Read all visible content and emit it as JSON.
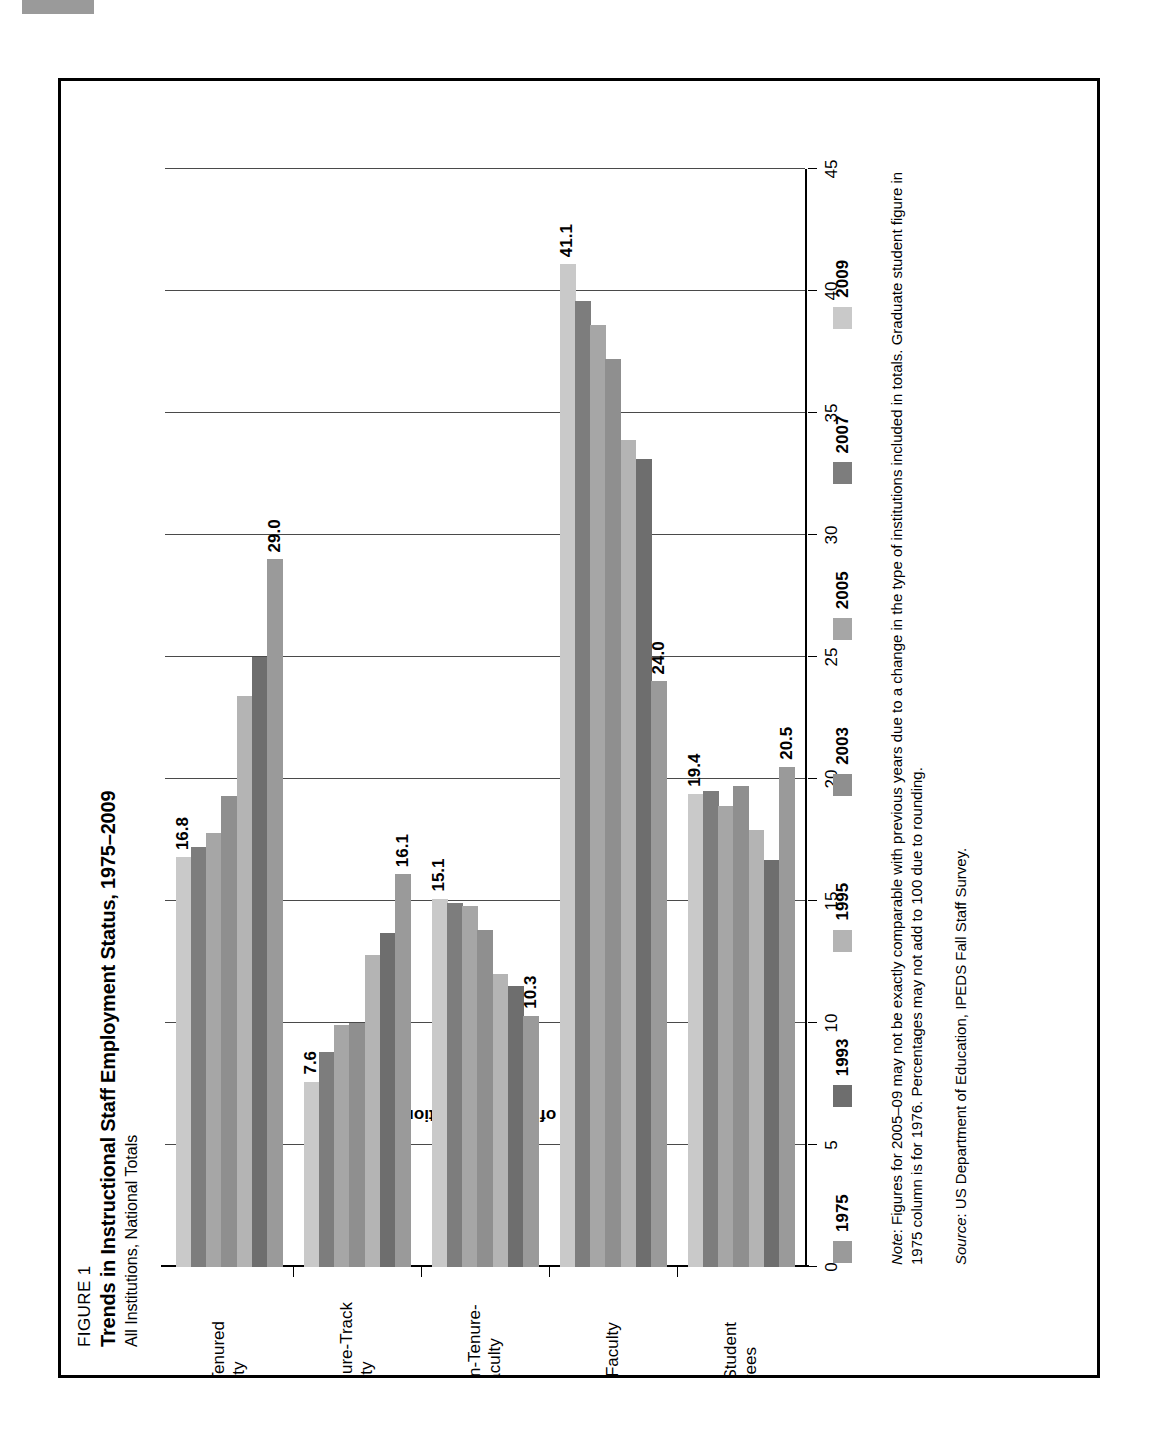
{
  "figure": {
    "label": "FIGURE 1",
    "title": "Trends in Instructional Staff Employment Status, 1975–2009",
    "subtitle": "All Institutions, National Totals"
  },
  "note": {
    "prefix": "Note",
    "text": ": Figures for 2005–09 may not be exactly comparable with previous years due to a change in the type of institutions included in totals. Graduate student figure in 1975 column is for 1976. Percentages may not add to 100 due to rounding."
  },
  "source": {
    "prefix": "Source",
    "text": ": US Department of Education, IPEDS Fall Staff Survey."
  },
  "colors": {
    "series_1975": "#9a9a9a",
    "series_1993": "#6e6e6e",
    "series_1995": "#b4b4b4",
    "series_2003": "#8f8f8f",
    "series_2005": "#a6a6a6",
    "series_2007": "#7d7d7d",
    "series_2009": "#c9c9c9",
    "axis": "#000000",
    "grid": "#4a4a4a"
  },
  "chart_data": {
    "type": "bar",
    "orientation": "horizontal",
    "title": "Trends in Instructional Staff Employment Status, 1975–2009",
    "subtitle": "All Institutions, National Totals",
    "xlabel": "",
    "ylabel": "Percent of Total Instructional Staff",
    "ylim": [
      0,
      45
    ],
    "yticks": [
      0,
      5,
      10,
      15,
      20,
      25,
      30,
      35,
      40,
      45
    ],
    "grid": true,
    "legend_position": "bottom",
    "categories": [
      "Full-Time Tenured Faculty",
      "Full-Time Tenure-Track Faculty",
      "Full-Time Non-Tenure-Track Faculty",
      "Part-Time Faculty",
      "Graduate Student Employees"
    ],
    "category_lines": [
      [
        "Full-Time Tenured",
        "Faculty"
      ],
      [
        "Full-Time Tenure-Track",
        "Faculty"
      ],
      [
        "Full-Time Non-Tenure-",
        "Track Faculty"
      ],
      [
        "Part-Time Faculty"
      ],
      [
        "Graduate Student",
        "Employees"
      ]
    ],
    "series": [
      {
        "name": "1975",
        "color": "#9a9a9a",
        "values": [
          29.0,
          16.1,
          10.3,
          24.0,
          20.5
        ]
      },
      {
        "name": "1993",
        "color": "#6e6e6e",
        "values": [
          25.0,
          13.7,
          11.5,
          33.1,
          16.7
        ]
      },
      {
        "name": "1995",
        "color": "#b4b4b4",
        "values": [
          23.4,
          12.8,
          12.0,
          33.9,
          17.9
        ]
      },
      {
        "name": "2003",
        "color": "#8f8f8f",
        "values": [
          19.3,
          10.0,
          13.8,
          37.2,
          19.7
        ]
      },
      {
        "name": "2005",
        "color": "#a6a6a6",
        "values": [
          17.8,
          9.9,
          14.8,
          38.6,
          18.9
        ]
      },
      {
        "name": "2007",
        "color": "#7d7d7d",
        "values": [
          17.2,
          8.8,
          14.9,
          39.6,
          19.5
        ]
      },
      {
        "name": "2009",
        "color": "#c9c9c9",
        "values": [
          16.8,
          7.6,
          15.1,
          41.1,
          19.4
        ]
      }
    ],
    "labeled_points": [
      {
        "category": "Full-Time Tenured Faculty",
        "series": "1975",
        "label": "29.0"
      },
      {
        "category": "Full-Time Tenured Faculty",
        "series": "2009",
        "label": "16.8"
      },
      {
        "category": "Full-Time Tenure-Track Faculty",
        "series": "1975",
        "label": "16.1"
      },
      {
        "category": "Full-Time Tenure-Track Faculty",
        "series": "2009",
        "label": "7.6"
      },
      {
        "category": "Full-Time Non-Tenure-Track Faculty",
        "series": "1975",
        "label": "10.3"
      },
      {
        "category": "Full-Time Non-Tenure-Track Faculty",
        "series": "2009",
        "label": "15.1"
      },
      {
        "category": "Part-Time Faculty",
        "series": "1975",
        "label": "24.0"
      },
      {
        "category": "Part-Time Faculty",
        "series": "2009",
        "label": "41.1"
      },
      {
        "category": "Graduate Student Employees",
        "series": "1975",
        "label": "20.5"
      },
      {
        "category": "Graduate Student Employees",
        "series": "2009",
        "label": "19.4"
      }
    ]
  }
}
